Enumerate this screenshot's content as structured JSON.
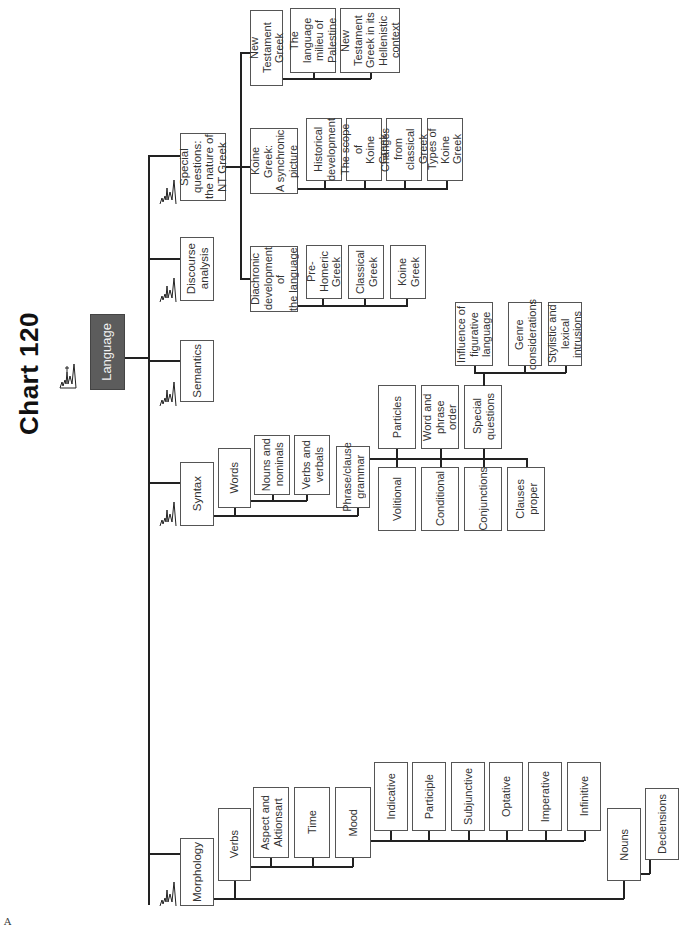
{
  "title": "Chart 120",
  "root": {
    "label": "Language",
    "color": "#5c5c5c"
  },
  "level1": [
    {
      "id": "special",
      "label": "Special questions:\nthe nature of\nNT Greek"
    },
    {
      "id": "discourse",
      "label": "Discourse\nanalysis"
    },
    {
      "id": "semantics",
      "label": "Semantics"
    },
    {
      "id": "syntax",
      "label": "Syntax"
    },
    {
      "id": "morphology",
      "label": "Morphology"
    }
  ],
  "special": {
    "nt_greek": {
      "label": "New Testament\nGreek",
      "children": [
        "The language\nmilieu of\nPalestine",
        "New Testament\nGreek in its\nHellenistic\ncontext"
      ]
    },
    "koine": {
      "label": "Koine Greek:\nA synchronic\npicture",
      "children": [
        "Historical\ndevelopment",
        "The scope of\nKoine Greek",
        "Changes from\nclassical Greek",
        "Types of\nKoine Greek"
      ]
    },
    "diachronic": {
      "label": "Diachronic\ndevelopment of\nthe language",
      "children": [
        "Pre-Homeric\nGreek",
        "Classical\nGreek",
        "Koine Greek"
      ]
    }
  },
  "syntax": {
    "words": {
      "label": "Words",
      "children": [
        "Nouns and\nnominals",
        "Verbs and\nverbals"
      ]
    },
    "phrase": {
      "label": "Phrase/clause\ngrammar",
      "upper": [
        "Particles",
        "Word and phrase\norder",
        "Special\nquestions"
      ],
      "lower": [
        "Volitional",
        "Conditional",
        "Conjunctions",
        "Clauses\nproper"
      ]
    },
    "special_questions_children": [
      "Influence of\nfigurative\nlanguage",
      "Genre\nconsiderations",
      "Stylistic and lexical\nintrusions"
    ]
  },
  "morphology": {
    "verbs": {
      "label": "Verbs",
      "children": [
        "Aspect and\nAktionsart",
        "Time",
        "Mood"
      ]
    },
    "mood_children": [
      "Indicative",
      "Participle",
      "Subjunctive",
      "Optative",
      "Imperative",
      "Infinitive"
    ],
    "nouns": {
      "label": "Nouns",
      "children": [
        "Declensions"
      ]
    }
  },
  "corner_mark": "A"
}
